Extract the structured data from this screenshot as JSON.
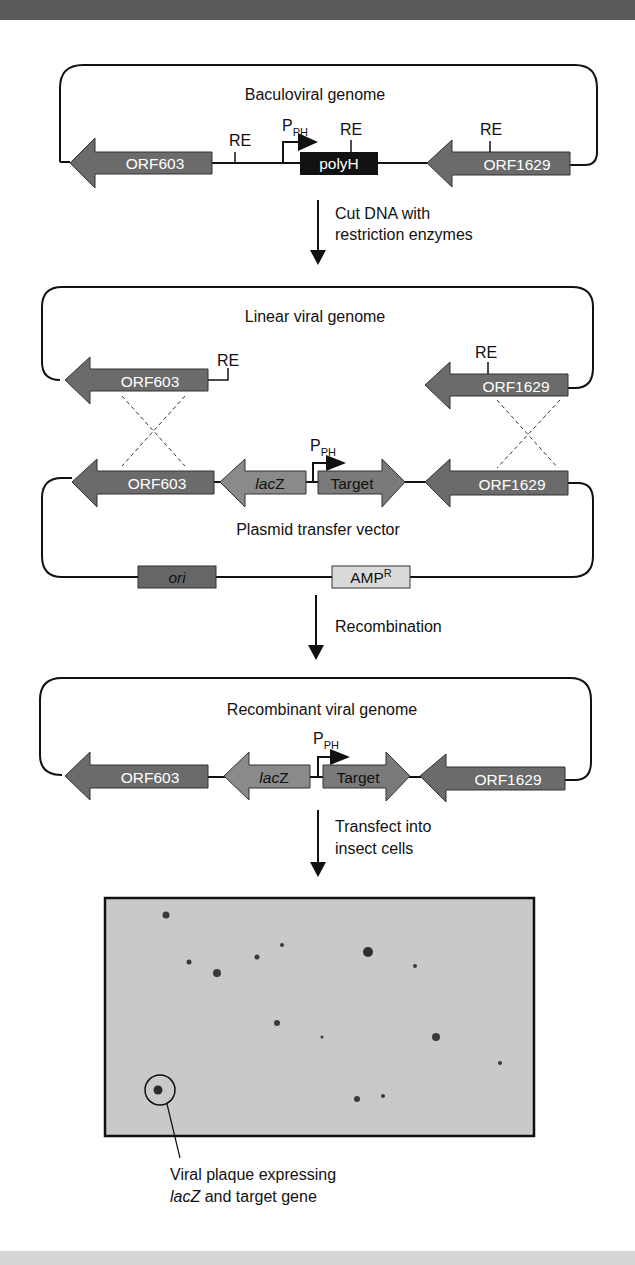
{
  "panels": {
    "baculoviral": {
      "title": "Baculoviral genome",
      "promoter": "P",
      "promoter_sub": "PH",
      "genes": [
        "ORF603",
        "polyH",
        "ORF1629"
      ],
      "sites": [
        "RE",
        "RE",
        "RE"
      ]
    },
    "step1": {
      "line1": "Cut DNA with",
      "line2": "restriction enzymes"
    },
    "linear": {
      "title": "Linear viral genome",
      "genes": [
        "ORF603",
        "ORF1629"
      ],
      "sites": [
        "RE",
        "RE"
      ]
    },
    "plasmid": {
      "title": "Plasmid transfer vector",
      "promoter": "P",
      "promoter_sub": "PH",
      "genes": [
        "ORF603",
        "lacZ",
        "Target",
        "ORF1629"
      ],
      "lacz_italic": "lac",
      "lacz_rest": "Z",
      "ori": "ori",
      "amp": "AMP",
      "amp_sup": "R"
    },
    "step2": {
      "label": "Recombination"
    },
    "recombinant": {
      "title": "Recombinant viral genome",
      "promoter": "P",
      "promoter_sub": "PH",
      "genes": [
        "ORF603",
        "lacZ",
        "Target",
        "ORF1629"
      ],
      "lacz_italic": "lac",
      "lacz_rest": "Z"
    },
    "step3": {
      "line1": "Transfect into",
      "line2": "insect cells"
    },
    "photo": {
      "caption_line1": "Viral plaque expressing",
      "caption_italic": "lacZ",
      "caption_rest": " and target gene"
    }
  },
  "colors": {
    "gene_dark": "#6b6b6b",
    "gene_mid": "#8a8a8a",
    "polyh": "#111111",
    "amp": "#d9d9d9",
    "photo_bg": "#c9c9c9"
  }
}
